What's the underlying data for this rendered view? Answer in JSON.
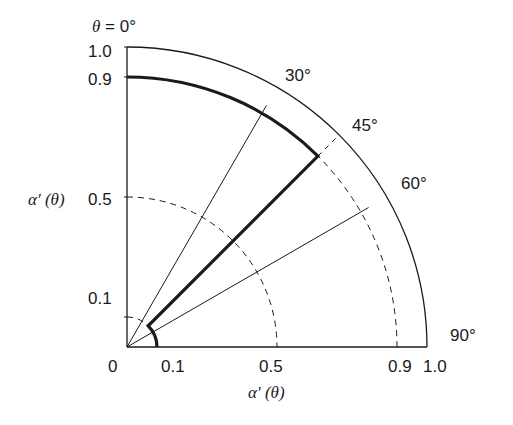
{
  "diagram": {
    "title": "θ = 0°",
    "origin_label": "0",
    "y_axis_label": "α′ (θ)",
    "x_axis_label": "α′ (θ)",
    "y_ticks": [
      {
        "value": 1.0,
        "label": "1.0"
      },
      {
        "value": 0.9,
        "label": "0.9"
      },
      {
        "value": 0.5,
        "label": "0.5"
      },
      {
        "value": 0.1,
        "label": "0.1"
      }
    ],
    "x_ticks": [
      {
        "value": 0.1,
        "label": "0.1"
      },
      {
        "value": 0.5,
        "label": "0.5"
      },
      {
        "value": 0.9,
        "label": "0.9"
      },
      {
        "value": 1.0,
        "label": "1.0"
      }
    ],
    "angle_labels": [
      {
        "deg": 30,
        "label": "30°"
      },
      {
        "deg": 45,
        "label": "45°"
      },
      {
        "deg": 60,
        "label": "60°"
      },
      {
        "deg": 90,
        "label": "90°"
      }
    ],
    "outer_arc_radius": 1.0,
    "dashed_arcs": [
      0.1,
      0.5,
      0.9
    ],
    "thin_rays_deg": [
      30,
      60
    ],
    "thick_path": {
      "description": "Bold contour: arc at r=0.9 from 0° to 45°, radial segment along 45° from r=0.9 to r=0.1, arc at r=0.1 from 45° to 90°",
      "outer_radius": 0.9,
      "inner_radius": 0.1,
      "split_angle_deg": 45
    },
    "colors": {
      "line": "#1a1a1a",
      "background": "#ffffff"
    }
  }
}
